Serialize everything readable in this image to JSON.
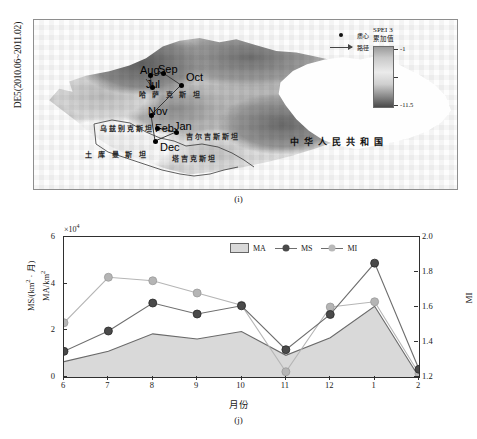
{
  "figure": {
    "panel_i": {
      "caption": "(i)",
      "side_label": "DE5(2010.06~2011.02)",
      "legend": {
        "centroid_label": "质心",
        "path_label": "路径",
        "centroid_icon": "filled-dot-icon",
        "path_icon": "arrow-right-icon"
      },
      "colorbar": {
        "title": "SPEI 3",
        "subtitle": "累加值",
        "max_label": "-1",
        "min_label": "-11.5",
        "gradient_top_color": "#9b9b9b",
        "gradient_bottom_color": "#4a4a4a"
      },
      "country_labels": [
        {
          "name": "kazakhstan",
          "text": "哈 萨 克 斯 坦",
          "x": 139,
          "y": 88
        },
        {
          "name": "uzbekistan",
          "text": "乌兹别克斯坦",
          "x": 100,
          "y": 122
        },
        {
          "name": "turkmenistan",
          "text": "土 库 曼 斯 坦",
          "x": 85,
          "y": 148
        },
        {
          "name": "kyrgyzstan",
          "text": "吉尔吉斯斯坦",
          "x": 186,
          "y": 130
        },
        {
          "name": "tajikistan",
          "text": "塔吉克斯坦",
          "x": 172,
          "y": 152
        },
        {
          "name": "china",
          "text": "中华人民共和国",
          "x": 290,
          "y": 134
        }
      ],
      "month_nodes": [
        {
          "label": "Jun",
          "x": 146,
          "y": 78,
          "lx": 142,
          "ly": 66
        },
        {
          "label": "Jul",
          "x": 152,
          "y": 86,
          "lx": 146,
          "ly": 77
        },
        {
          "label": "Aug",
          "x": 150,
          "y": 74,
          "lx": 140,
          "ly": 63
        },
        {
          "label": "Sep",
          "x": 163,
          "y": 72,
          "lx": 158,
          "ly": 62
        },
        {
          "label": "Oct",
          "x": 181,
          "y": 84,
          "lx": 186,
          "ly": 70
        },
        {
          "label": "Nov",
          "x": 151,
          "y": 114,
          "lx": 148,
          "ly": 104
        },
        {
          "label": "Dec",
          "x": 155,
          "y": 140,
          "lx": 160,
          "ly": 140
        },
        {
          "label": "Jan",
          "x": 176,
          "y": 131,
          "lx": 174,
          "ly": 119
        },
        {
          "label": "Feb",
          "x": 157,
          "y": 127,
          "lx": 155,
          "ly": 121
        }
      ]
    },
    "panel_j": {
      "caption": "(j)"
    }
  },
  "chart_data": {
    "type": "line",
    "title": "",
    "subtitle": "",
    "xlabel": "月份",
    "ylabel": "MS/(km² · 月)  MA/km²",
    "ylabel_line1": "MS/(km",
    "ylabel_line1_sup": "2",
    "ylabel_line1_tail": " · 月)",
    "ylabel_line2": "MA/km",
    "ylabel_line2_sup": "2",
    "y2label": "MI",
    "y_exponent_label": "×10",
    "y_exponent_sup": "4",
    "categories": [
      "6",
      "7",
      "8",
      "9",
      "10",
      "11",
      "12",
      "1",
      "2"
    ],
    "ylim": [
      0,
      6
    ],
    "yticks": [
      "0",
      "2",
      "4",
      "6"
    ],
    "y2lim": [
      1.2,
      2.0
    ],
    "y2ticks": [
      "1.2",
      "1.4",
      "1.6",
      "1.8",
      "2.0"
    ],
    "grid": false,
    "legend_position": "top-right",
    "series": [
      {
        "name": "MA",
        "type": "area",
        "axis": "left",
        "color": "#d9d9d9",
        "edge_color": "#6a6a6a",
        "values": [
          0.66,
          1.1,
          1.85,
          1.63,
          1.95,
          0.93,
          1.68,
          3.03,
          0.0
        ]
      },
      {
        "name": "MS",
        "type": "line",
        "axis": "left",
        "color": "#4a4a4a",
        "marker": "circle",
        "values": [
          1.1,
          1.97,
          3.17,
          2.7,
          3.05,
          1.17,
          2.68,
          4.88,
          0.33
        ]
      },
      {
        "name": "MI",
        "type": "line",
        "axis": "right",
        "color": "#b5b5b5",
        "marker": "circle",
        "values": [
          1.51,
          1.77,
          1.75,
          1.68,
          1.61,
          1.23,
          1.6,
          1.63,
          1.22
        ]
      }
    ]
  }
}
